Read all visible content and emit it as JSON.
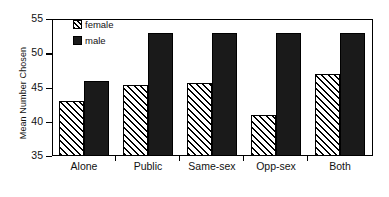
{
  "chart_data": {
    "type": "bar",
    "title": "",
    "xlabel": "",
    "ylabel": "Mean Number Chosen",
    "categories": [
      "Alone",
      "Public",
      "Same-sex",
      "Opp-sex",
      "Both"
    ],
    "series": [
      {
        "name": "female",
        "values": [
          43,
          45.4,
          45.6,
          41,
          47
        ],
        "pattern": "diagonal-hatch",
        "color": "#ffffff"
      },
      {
        "name": "male",
        "values": [
          46,
          53,
          53,
          53,
          53
        ],
        "pattern": "solid",
        "color": "#1a1a1a"
      }
    ],
    "ylim": [
      35,
      55
    ],
    "yticks": [
      35,
      40,
      45,
      50,
      55
    ],
    "ytick_labels": [
      "35",
      "40",
      "45",
      "50",
      "55"
    ],
    "grid": false,
    "legend_position": "top-left-inside"
  },
  "legend": {
    "items": [
      {
        "label": "female"
      },
      {
        "label": "male"
      }
    ]
  },
  "colors": {
    "axis": "#000000",
    "male_fill": "#1a1a1a",
    "female_fill": "#ffffff",
    "background": "#ffffff"
  }
}
